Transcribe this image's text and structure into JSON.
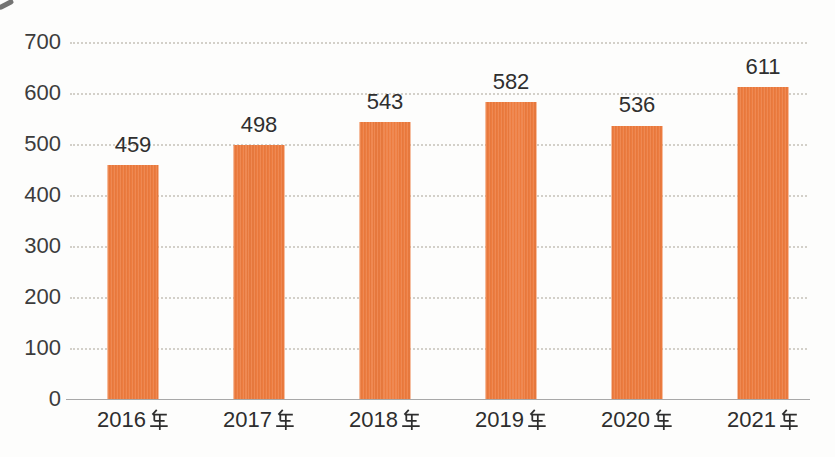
{
  "chart_data": {
    "type": "bar",
    "title": "",
    "xlabel": "",
    "ylabel": "",
    "categories": [
      "2016年",
      "2017年",
      "2018年",
      "2019年",
      "2020年",
      "2021年"
    ],
    "values": [
      459,
      498,
      543,
      582,
      536,
      611
    ],
    "value_labels_shown": true,
    "ylim": [
      0,
      700
    ],
    "yticks": [
      0,
      100,
      200,
      300,
      400,
      500,
      600,
      700
    ],
    "grid": "horizontal-dotted",
    "legend": "none",
    "colors": {
      "bar": "#ED7C3F",
      "bar_stripe_light": "rgba(255,255,255,0.10)",
      "bar_stripe_dark": "rgba(0,0,0,0.03)",
      "value_label": "#2F2F2F",
      "axis_tick_label": "#3C3C3C",
      "category_label": "#2E2E2E",
      "gridline": "#D3D0C9",
      "baseline": "#A8A8A8",
      "background": "#FDFDFC"
    }
  }
}
